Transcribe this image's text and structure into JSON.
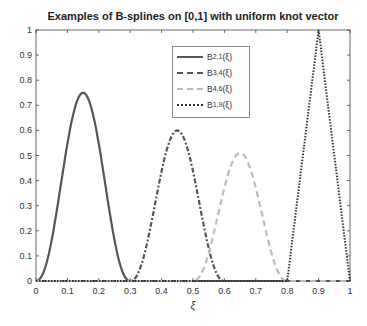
{
  "chart_data": {
    "type": "line",
    "title": "Examples of B-splines on [0,1] with uniform knot vector",
    "xlabel": "ξ",
    "ylabel": "",
    "xlim": [
      0,
      1
    ],
    "ylim": [
      0,
      1
    ],
    "xticks": [
      "0",
      "0.1",
      "0.2",
      "0.3",
      "0.4",
      "0.5",
      "0.6",
      "0.7",
      "0.8",
      "0.9",
      "1"
    ],
    "yticks": [
      "0",
      "0.1",
      "0.2",
      "0.3",
      "0.4",
      "0.5",
      "0.6",
      "0.7",
      "0.8",
      "0.9",
      "1"
    ],
    "grid": false,
    "legend_position": "upper center",
    "series": [
      {
        "name": "B_{2,1}(ξ)",
        "style": "solid",
        "color": "#555555",
        "support": [
          0,
          0.3
        ],
        "peak_x": 0.15,
        "peak_y": 0.75
      },
      {
        "name": "B_{3,4}(ξ)",
        "style": "dashdot",
        "color": "#555555",
        "support": [
          0.3,
          0.6
        ],
        "peak_x": 0.45,
        "peak_y": 0.6
      },
      {
        "name": "B_{4,6}(ξ)",
        "style": "dashed",
        "color": "#bbbbbb",
        "support": [
          0.5,
          0.8
        ],
        "peak_x": 0.65,
        "peak_y": 0.51
      },
      {
        "name": "B_{1,9}(ξ)",
        "style": "dotted",
        "color": "#333333",
        "support": [
          0.8,
          1.0
        ],
        "peak_x": 0.9,
        "peak_y": 1.0
      }
    ]
  },
  "legend": {
    "items": [
      {
        "base": "B",
        "sub": "2,1",
        "arg": "(ξ)"
      },
      {
        "base": "B",
        "sub": "3,4",
        "arg": "(ξ)"
      },
      {
        "base": "B",
        "sub": "4,6",
        "arg": "(ξ)"
      },
      {
        "base": "B",
        "sub": "1,9",
        "arg": "(ξ)"
      }
    ]
  }
}
